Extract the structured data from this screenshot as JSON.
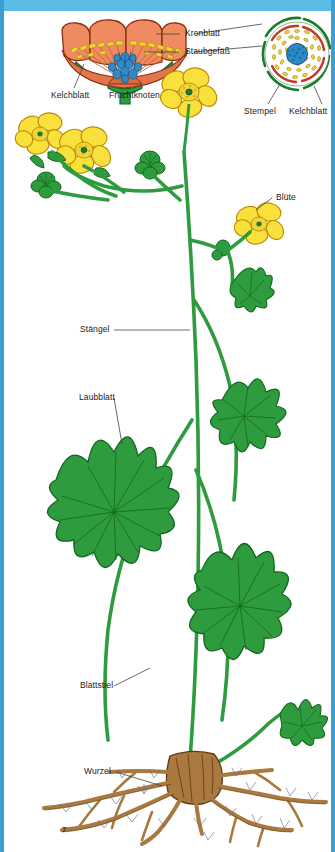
{
  "page": {
    "page_number": "7",
    "accent_color": "#3C9FD4",
    "banner_color": "#5BBCE4",
    "background_color": "#ffffff"
  },
  "labels": {
    "kronblatt": "Kronblatt",
    "staubgefaess": "Staubgefäß",
    "kelchblatt_left": "Kelchblatt",
    "fruchtknoten": "Fruchtknoten",
    "stempel": "Stempel",
    "kelchblatt_right": "Kelchblatt",
    "bluete": "Blüte",
    "staengel": "Stängel",
    "laubblatt": "Laubblatt",
    "blattstiel": "Blattstiel",
    "wurzel": "Wurzel"
  },
  "colors": {
    "petal_section": "#F08A61",
    "petal_section_dark": "#D96A42",
    "petal_yellow": "#FAE03C",
    "petal_yellow_dark": "#E8B800",
    "stamen_yellow": "#F2D43A",
    "pistil_blue": "#2E8BC8",
    "pistil_blue_dark": "#1B5E8C",
    "leaf_green": "#2E9B3E",
    "leaf_green_dark": "#14661F",
    "stem_green": "#2E9B3E",
    "sepal_green": "#1D7A2B",
    "cross_ring_red": "#C0392B",
    "root_brown": "#A9793F",
    "root_brown_dark": "#6B4420",
    "leader_line": "#444444"
  },
  "diagram": {
    "type": "botanical-illustration",
    "parts": [
      {
        "name": "flower-longitudinal-section",
        "label": "Kronblatt / Staubgefäß / Kelchblatt / Fruchtknoten"
      },
      {
        "name": "flower-cross-section",
        "label": "Stempel / Kelchblatt"
      },
      {
        "name": "whole-plant",
        "label": "Blüte / Stängel / Laubblatt / Blattstiel / Wurzel"
      }
    ]
  }
}
